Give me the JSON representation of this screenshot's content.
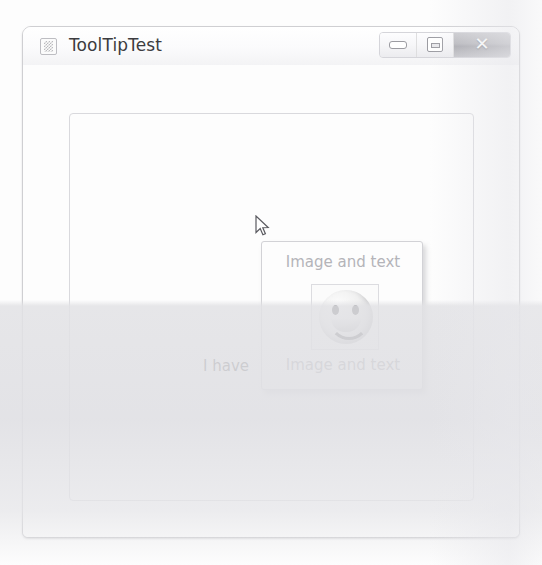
{
  "window": {
    "title": "ToolTipTest",
    "icon": "app-icon",
    "controls": {
      "minimize_label": "–",
      "maximize_label": "❐",
      "close_label": "✕"
    }
  },
  "client": {
    "panel_label": "I have"
  },
  "tooltip": {
    "top_text": "Image and text",
    "bottom_text": "Image and text",
    "image_alt": "smiley-face"
  },
  "cursor": {
    "type": "arrow-pointer"
  },
  "colors": {
    "window_border": "#cfcfd2",
    "titlebar_text": "#3c3c40",
    "tooltip_border": "#d2d2d6",
    "tooltip_background": "#fdfdfd",
    "tooltip_text_top": "#b4b4b9",
    "tooltip_text_bottom": "#8e8e94",
    "close_button": "#b6b6bb",
    "label_text": "#3a3a3e"
  }
}
